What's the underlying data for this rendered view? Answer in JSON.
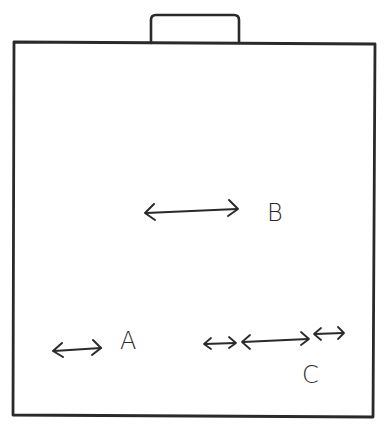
{
  "diagram": {
    "colors": {
      "ink": "#2a2a2a",
      "background": "#ffffff"
    },
    "container": {
      "shape": "rectangle",
      "has_top_tab": true
    },
    "labels": {
      "a": "A",
      "b": "B",
      "c": "C"
    },
    "arrows": [
      {
        "id": "arrow-a",
        "type": "double-headed",
        "label": "A",
        "length": "short"
      },
      {
        "id": "arrow-b",
        "type": "double-headed",
        "label": "B",
        "length": "long"
      },
      {
        "id": "arrow-c-1",
        "type": "double-headed",
        "label": "C",
        "length": "very short"
      },
      {
        "id": "arrow-c-2",
        "type": "double-headed",
        "label": "C",
        "length": "medium"
      },
      {
        "id": "arrow-c-3",
        "type": "double-headed",
        "label": "C",
        "length": "very short"
      }
    ]
  }
}
